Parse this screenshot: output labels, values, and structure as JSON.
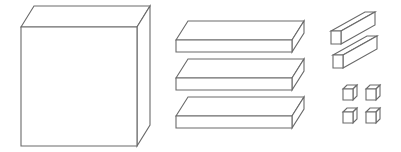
{
  "diagram": {
    "type": "base-ten-blocks",
    "stroke_color": "#6a6a6a",
    "background": "#ffffff",
    "groups": [
      {
        "name": "thousand-cube",
        "count": 1
      },
      {
        "name": "hundred-flats",
        "count": 3
      },
      {
        "name": "ten-rods",
        "count": 2
      },
      {
        "name": "unit-cubes",
        "count": 4
      }
    ],
    "boxes": [
      {
        "id": "big-cube",
        "x": 21,
        "y": 27,
        "w": 116,
        "h": 119,
        "dx": 13,
        "dy": -21
      },
      {
        "id": "flat-1",
        "x": 176,
        "y": 40,
        "w": 116,
        "h": 12,
        "dx": 12,
        "dy": -19
      },
      {
        "id": "flat-2",
        "x": 176,
        "y": 78,
        "w": 116,
        "h": 12,
        "dx": 12,
        "dy": -19
      },
      {
        "id": "flat-3",
        "x": 176,
        "y": 116,
        "w": 116,
        "h": 12,
        "dx": 12,
        "dy": -19
      },
      {
        "id": "rod-1",
        "x": 331,
        "y": 31,
        "w": 10,
        "h": 13,
        "dx": 34,
        "dy": -19
      },
      {
        "id": "rod-2",
        "x": 333,
        "y": 55,
        "w": 10,
        "h": 13,
        "dx": 34,
        "dy": -19
      },
      {
        "id": "unit-1",
        "x": 343,
        "y": 89,
        "w": 10,
        "h": 11,
        "dx": 4,
        "dy": -4
      },
      {
        "id": "unit-2",
        "x": 366,
        "y": 89,
        "w": 10,
        "h": 11,
        "dx": 4,
        "dy": -4
      },
      {
        "id": "unit-3",
        "x": 343,
        "y": 112,
        "w": 10,
        "h": 11,
        "dx": 4,
        "dy": -4
      },
      {
        "id": "unit-4",
        "x": 366,
        "y": 112,
        "w": 10,
        "h": 11,
        "dx": 4,
        "dy": -4
      }
    ]
  }
}
